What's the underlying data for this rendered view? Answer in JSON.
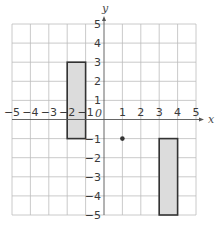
{
  "chart_data": {
    "type": "coordinate-grid",
    "xlabel": "x",
    "ylabel": "y",
    "origin_label": "0",
    "xlim": [
      -5,
      5
    ],
    "ylim": [
      -5,
      5
    ],
    "grid": true,
    "x_ticks": [
      "−5",
      "−4",
      "−3",
      "−2",
      "−1",
      "1",
      "2",
      "3",
      "4",
      "5"
    ],
    "y_ticks": [
      "5",
      "4",
      "3",
      "2",
      "1",
      "−1",
      "−2",
      "−3",
      "−4",
      "−5"
    ],
    "shapes": [
      {
        "name": "rectangle-a",
        "type": "rectangle",
        "x1": -2,
        "y1": -1,
        "x2": -1,
        "y2": 3,
        "fill": "#dcdcdc",
        "stroke": "#333333"
      },
      {
        "name": "rectangle-b",
        "type": "rectangle",
        "x1": 3,
        "y1": -5,
        "x2": 4,
        "y2": -1,
        "fill": "#dcdcdc",
        "stroke": "#333333"
      }
    ],
    "points": [
      {
        "name": "point-1-neg1",
        "x": 1,
        "y": -1,
        "color": "#333333"
      }
    ]
  },
  "colors": {
    "grid": "#bdbdbd",
    "axis": "#555555",
    "shape_fill": "#dcdcdc",
    "shape_stroke": "#333333"
  }
}
